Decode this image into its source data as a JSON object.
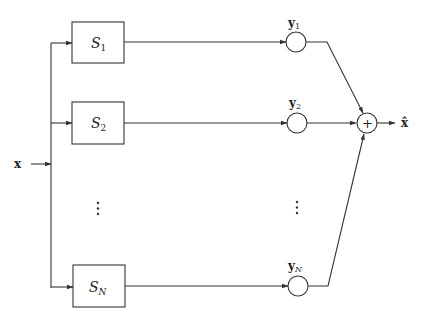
{
  "diagram": {
    "type": "block-diagram",
    "input": {
      "label": "x"
    },
    "output": {
      "label": "x̂"
    },
    "branches": [
      {
        "block": {
          "main": "S",
          "sub": "1"
        },
        "output": {
          "main": "y",
          "sub": "1"
        }
      },
      {
        "block": {
          "main": "S",
          "sub": "2"
        },
        "output": {
          "main": "y",
          "sub": "2"
        }
      },
      {
        "block": {
          "main": "S",
          "sub": "N"
        },
        "output": {
          "main": "y",
          "sub": "N"
        }
      }
    ],
    "ellipsis": "⋮",
    "summer": {
      "symbol": "+"
    },
    "colors": {
      "stroke": "#333333",
      "background": "#ffffff"
    }
  }
}
